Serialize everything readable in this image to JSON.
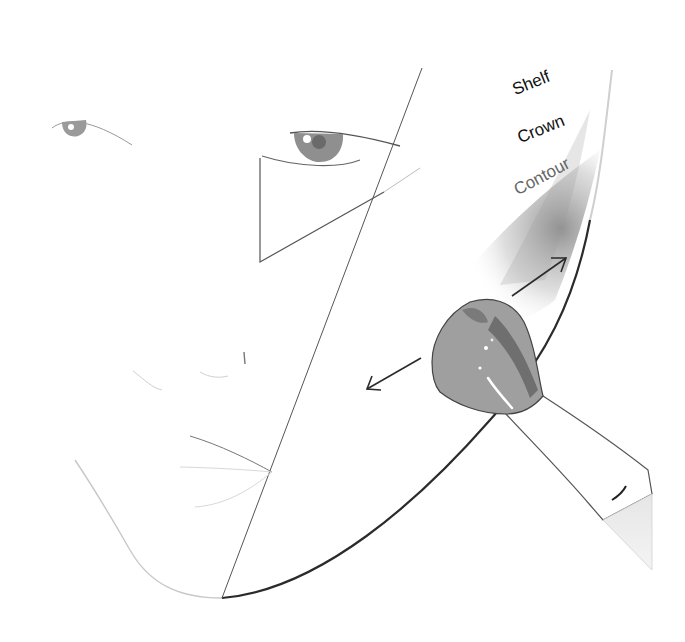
{
  "diagram": {
    "type": "face-contouring-guide",
    "labels": {
      "shelf": "Shelf",
      "crown": "Crown",
      "contour": "Contour"
    },
    "colors": {
      "background": "#ffffff",
      "line_dark": "#2b2b2b",
      "line_light": "#bdbdbd",
      "shadow": "#8a8a8a",
      "brush_head": "#9a9a9a",
      "brush_head_dark": "#6e6e6e",
      "brush_handle": "#ffffff"
    },
    "elements": {
      "face_outline": "face-outline",
      "cheek_line": "diagonal-cheek-line",
      "triangle": "under-eye-triangle",
      "arrows": [
        "arrow-up-right",
        "arrow-down-left"
      ],
      "brush": "makeup-brush"
    }
  }
}
